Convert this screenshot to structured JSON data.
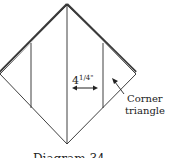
{
  "diagram": {
    "measurement_label": "4",
    "measurement_fraction": "1/4\"",
    "callout_line1": "Corner",
    "callout_line2": "triangle",
    "caption": "Diagram 34"
  },
  "colors": {
    "stroke": "#2a2a2a",
    "thick_edge": "#3a3a3a",
    "background": "#ffffff"
  }
}
